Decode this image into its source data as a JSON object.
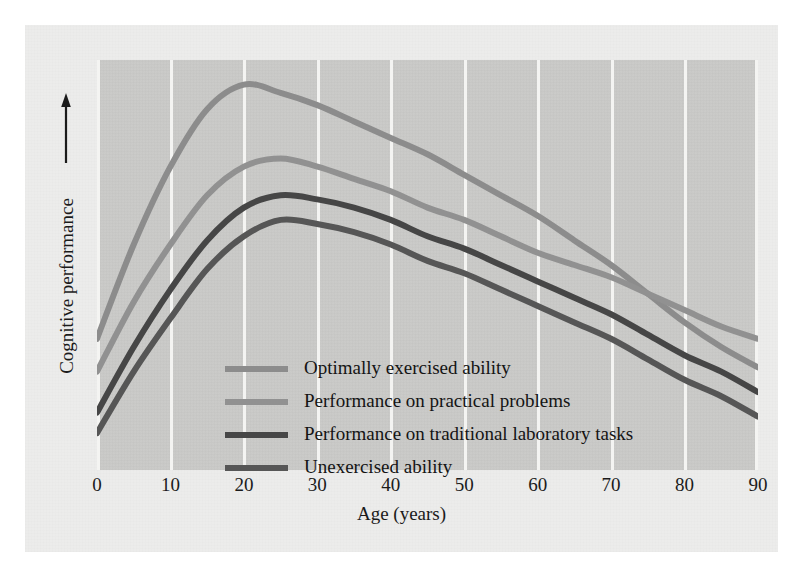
{
  "figure": {
    "page_background": "#ececeb",
    "plot_background": "#c9c9c7",
    "gridline_color": "#f4f4f2",
    "text_color": "#1b1b1b"
  },
  "axes": {
    "x_title": "Age (years)",
    "y_title": "Cognitive performance",
    "y_arrow_icon": "up-arrow-icon",
    "x_ticks": [
      "0",
      "10",
      "20",
      "30",
      "40",
      "50",
      "60",
      "70",
      "80",
      "90"
    ]
  },
  "legend": {
    "items": [
      {
        "label": "Optimally exercised ability",
        "color": "#8c8c8c"
      },
      {
        "label": "Performance on practical problems",
        "color": "#919191"
      },
      {
        "label": "Performance on traditional laboratory tasks",
        "color": "#464646"
      },
      {
        "label": "Unexercised ability",
        "color": "#565656"
      }
    ]
  },
  "chart_data": {
    "type": "line",
    "title": "",
    "xlabel": "Age (years)",
    "ylabel": "Cognitive performance",
    "xlim": [
      0,
      90
    ],
    "ylim": [
      0,
      100
    ],
    "grid": "vertical-only",
    "legend_position": "inside-lower-left",
    "x_ticks": [
      0,
      10,
      20,
      30,
      40,
      50,
      60,
      70,
      80,
      90
    ],
    "y_ticks": [],
    "x": [
      0,
      5,
      10,
      15,
      20,
      25,
      30,
      35,
      40,
      45,
      50,
      55,
      60,
      65,
      70,
      75,
      80,
      85,
      90
    ],
    "series": [
      {
        "name": "Optimally exercised ability",
        "color": "#8c8c8c",
        "values": [
          32,
          55,
          74,
          88,
          94,
          92,
          89,
          85,
          81,
          77,
          72,
          67,
          62,
          56,
          50,
          43,
          36,
          30,
          25
        ]
      },
      {
        "name": "Performance on practical problems",
        "color": "#919191",
        "values": [
          24,
          41,
          55,
          67,
          74,
          76,
          74,
          71,
          68,
          64,
          61,
          57,
          53,
          50,
          47,
          43,
          39,
          35,
          32
        ]
      },
      {
        "name": "Performance on traditional laboratory tasks",
        "color": "#464646",
        "values": [
          14,
          30,
          44,
          56,
          64,
          67,
          66,
          64,
          61,
          57,
          54,
          50,
          46,
          42,
          38,
          33,
          28,
          24,
          19
        ]
      },
      {
        "name": "Unexercised ability",
        "color": "#565656",
        "values": [
          9,
          24,
          37,
          49,
          57,
          61,
          60,
          58,
          55,
          51,
          48,
          44,
          40,
          36,
          32,
          27,
          22,
          18,
          13
        ]
      }
    ],
    "annotations": [
      "Optimally exercised ability and Performance on practical problems curves cross near age 70"
    ]
  }
}
